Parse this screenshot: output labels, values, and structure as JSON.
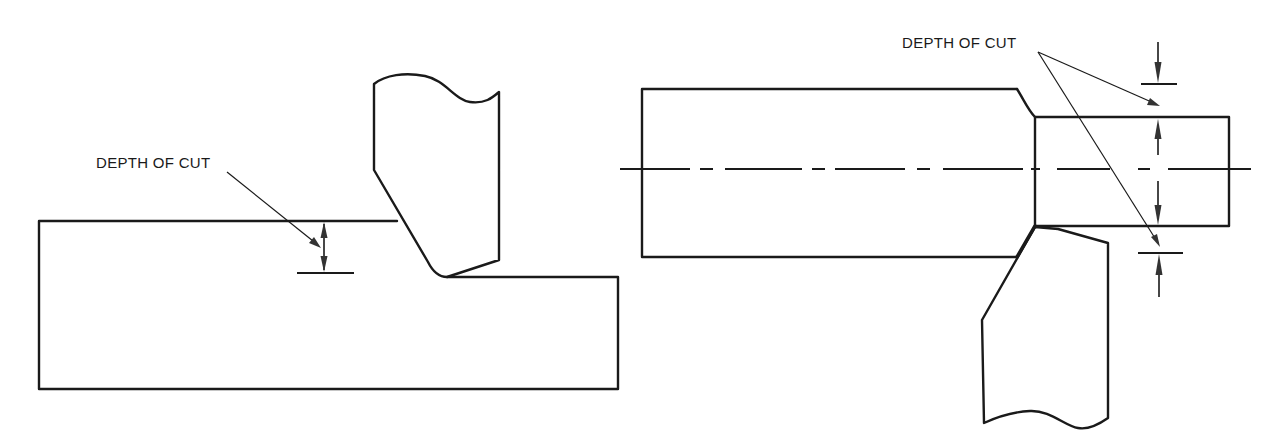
{
  "figures": [
    {
      "id": "left",
      "title": "Flat workpiece (facing / shaping)",
      "label": "DEPTH OF CUT",
      "elements": [
        "workpiece",
        "cutting-tool",
        "depth-dimension",
        "leader-arrow"
      ]
    },
    {
      "id": "right",
      "title": "Cylindrical workpiece (turning)",
      "label": "DEPTH OF CUT",
      "elements": [
        "large-cylinder",
        "reduced-cylinder",
        "centerline",
        "cutting-tool",
        "upper-depth-dimension",
        "lower-depth-dimension",
        "leader-arrows"
      ]
    }
  ],
  "colors": {
    "line": "#1a1a1a",
    "dimension": "#333333",
    "background": "#ffffff"
  }
}
